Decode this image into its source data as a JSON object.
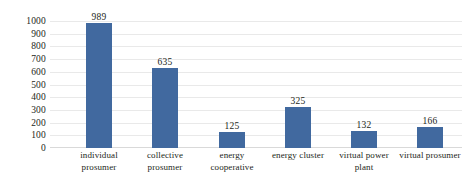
{
  "chart_data": {
    "type": "bar",
    "title": "",
    "subtitle": "",
    "xlabel": "",
    "ylabel": "",
    "ylim": [
      0,
      1000
    ],
    "ytick_step": 100,
    "yticks": [
      "1000",
      "900",
      "800",
      "700",
      "600",
      "500",
      "400",
      "300",
      "200",
      "100",
      "0"
    ],
    "grid": true,
    "legend": false,
    "legend_position": "none",
    "bar_color": "#41699f",
    "categories": [
      "individual prosumer",
      "collective prosumer",
      "energy cooperative",
      "energy cluster",
      "virtual power plant",
      "virtual prosumer"
    ],
    "category_lines": [
      [
        "individual",
        "prosumer"
      ],
      [
        "collective",
        "prosumer"
      ],
      [
        "energy",
        "cooperative"
      ],
      [
        "energy cluster",
        ""
      ],
      [
        "virtual power",
        "plant"
      ],
      [
        "virtual prosumer",
        ""
      ]
    ],
    "values": [
      989,
      635,
      125,
      325,
      132,
      166
    ],
    "value_labels": [
      "989",
      "635",
      "125",
      "325",
      "132",
      "166"
    ]
  }
}
